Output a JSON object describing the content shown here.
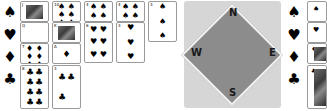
{
  "game": "Bridge",
  "left_hand": {
    "suits": [
      {
        "name": "spades",
        "symbol": "♠"
      },
      {
        "name": "hearts",
        "symbol": "♥"
      },
      {
        "name": "diamonds",
        "symbol": "♦"
      },
      {
        "name": "clubs",
        "symbol": "♣"
      }
    ],
    "rows": [
      {
        "suit": "spades",
        "cards": [
          {
            "rank": "J",
            "symbol": "♠",
            "type": "face"
          },
          {
            "rank": "10",
            "symbol": "♠",
            "pips": "♠♠♠♠♠♠"
          },
          {
            "rank": "4",
            "symbol": "♠",
            "pips": "♠♠♠♠"
          },
          {
            "rank": "4",
            "symbol": "♠",
            "pips": "♠♠♠♠"
          },
          {
            "rank": "3",
            "symbol": "♠",
            "pips": "♠♠♠"
          }
        ]
      },
      {
        "suit": "hearts",
        "cards": [
          {
            "rank": "Q",
            "symbol": "♥",
            "type": "face"
          },
          {
            "rank": "K",
            "symbol": "♥",
            "type": "face"
          },
          {
            "rank": "6",
            "symbol": "♥",
            "pips": "♥♥♥♥♥♥"
          },
          {
            "rank": "3",
            "symbol": "♥",
            "pips": "♥♥♥"
          }
        ]
      },
      {
        "suit": "diamonds",
        "cards": [
          {
            "rank": "7",
            "symbol": "♦",
            "pips": "♦♦♦♦♦♦♦"
          },
          {
            "rank": "A",
            "symbol": "♦",
            "pips": "♦"
          }
        ]
      },
      {
        "suit": "clubs",
        "cards": [
          {
            "rank": "8",
            "symbol": "♣",
            "pips": "♣♣♣♣♣♣♣♣"
          },
          {
            "rank": "3",
            "symbol": "♣",
            "pips": "♣♣♣"
          }
        ]
      }
    ]
  },
  "compass": {
    "north": "N",
    "south": "S",
    "east": "E",
    "west": "W"
  },
  "right_hand": {
    "suits": [
      {
        "name": "spades",
        "symbol": "♠"
      },
      {
        "name": "hearts",
        "symbol": "♥"
      },
      {
        "name": "diamonds",
        "symbol": "♦"
      },
      {
        "name": "clubs",
        "symbol": "♣"
      }
    ],
    "cards": [
      {
        "suit": "spades",
        "symbol": "♠"
      },
      {
        "suit": "hearts",
        "symbol": "♥"
      },
      {
        "suit": "diamonds",
        "symbol": "♦",
        "type": "face"
      },
      {
        "suit": "clubs",
        "symbol": "♣",
        "type": "face"
      }
    ]
  }
}
